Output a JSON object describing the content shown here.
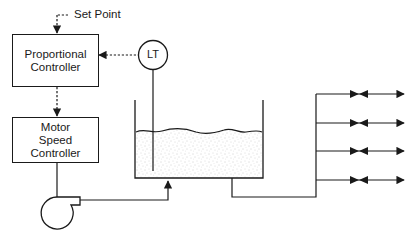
{
  "diagram": {
    "type": "process-control-schematic",
    "nodes": {
      "set_point": {
        "label": "Set Point"
      },
      "proportional_controller": {
        "line1": "Proportional",
        "line2": "Controller"
      },
      "motor_speed_controller": {
        "line1": "Motor",
        "line2": "Speed",
        "line3": "Controller"
      },
      "level_transmitter": {
        "label": "LT"
      },
      "pump": {
        "label": ""
      },
      "tank": {
        "label": ""
      }
    },
    "edges": [
      {
        "from": "set_point",
        "to": "proportional_controller",
        "style": "dashed",
        "arrow": true
      },
      {
        "from": "level_transmitter",
        "to": "proportional_controller",
        "style": "dashed",
        "arrow": true
      },
      {
        "from": "proportional_controller",
        "to": "motor_speed_controller",
        "style": "dashed",
        "arrow": true
      },
      {
        "from": "motor_speed_controller",
        "to": "pump",
        "style": "solid",
        "arrow": false
      },
      {
        "from": "pump",
        "to": "tank",
        "style": "solid",
        "arrow": true
      },
      {
        "from": "tank",
        "to": "distribution_header",
        "style": "solid",
        "arrow": false
      }
    ],
    "distribution_branches": 4
  }
}
